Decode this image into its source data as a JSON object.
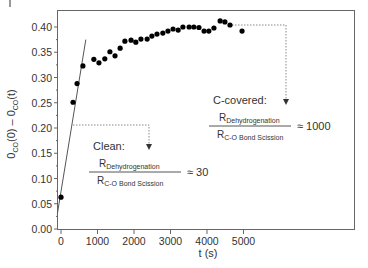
{
  "chart_data": {
    "type": "scatter",
    "title": "",
    "xlabel": "t (s)",
    "ylabel": "θCO(0) − θCO(t)",
    "ylabel_parts": {
      "a": "0",
      "a_sub": "CO",
      "b": "(0) – 0",
      "b_sub": "CO",
      "c": "(t)"
    },
    "xlim": [
      -200,
      8000
    ],
    "ylim": [
      0.0,
      0.43
    ],
    "x_ticks": [
      0,
      1000,
      2000,
      3000,
      4000,
      5000
    ],
    "x_tick_labels": [
      "0",
      "1000",
      "2000",
      "3000",
      "4000",
      "5000"
    ],
    "y_ticks": [
      0.0,
      0.05,
      0.1,
      0.15,
      0.2,
      0.25,
      0.3,
      0.35,
      0.4
    ],
    "y_tick_labels": [
      "0.00",
      "0.05",
      "0.10",
      "0.15",
      "0.20",
      "0.25",
      "0.30",
      "0.35",
      "0.40"
    ],
    "grid": false,
    "legend": null,
    "series": [
      {
        "name": "data",
        "marker": "circle",
        "color": "#000000",
        "x": [
          0,
          330,
          440,
          600,
          900,
          1040,
          1200,
          1340,
          1480,
          1620,
          1750,
          1920,
          2050,
          2190,
          2360,
          2490,
          2630,
          2790,
          2930,
          3070,
          3210,
          3340,
          3510,
          3640,
          3780,
          3920,
          4050,
          4190,
          4360,
          4490,
          4630,
          4960
        ],
        "y": [
          0.063,
          0.251,
          0.288,
          0.323,
          0.336,
          0.329,
          0.337,
          0.351,
          0.343,
          0.358,
          0.372,
          0.374,
          0.37,
          0.376,
          0.376,
          0.382,
          0.386,
          0.388,
          0.392,
          0.396,
          0.394,
          0.4,
          0.4,
          0.4,
          0.399,
          0.392,
          0.392,
          0.398,
          0.412,
          0.41,
          0.404,
          0.392
        ]
      },
      {
        "name": "initial-rate fit line",
        "type": "line",
        "color": "#555555",
        "x": [
          -100,
          680
        ],
        "y": [
          0.03,
          0.375
        ]
      }
    ],
    "annotations": [
      {
        "label": "Clean:",
        "numerator": "R",
        "numerator_sub": "Dehydrogenation",
        "denominator": "R",
        "denominator_sub": "C-O Bond Scission",
        "ratio": "≈ 30",
        "points_to_y": 0.2
      },
      {
        "label": "C-covered:",
        "numerator": "R",
        "numerator_sub": "Dehydrogenation",
        "denominator": "R",
        "denominator_sub": "C-O Bond Scission",
        "ratio": "≈ 1000",
        "points_to_y": 0.4
      }
    ]
  }
}
